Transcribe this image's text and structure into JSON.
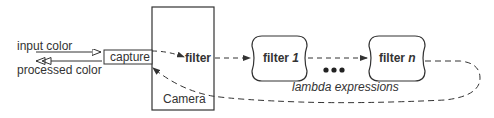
{
  "diagram": {
    "left_labels": {
      "input": "input color",
      "output": "processed color"
    },
    "capture_label": "capture",
    "camera_label": "Camera",
    "filter_label": "filter",
    "filters": [
      {
        "prefix": "filter ",
        "suffix": "1"
      },
      {
        "prefix": "filter ",
        "suffix": "n"
      }
    ],
    "ellipsis": "●●●",
    "caption": "lambda expressions",
    "colors": {
      "stroke": "#333333",
      "text": "#333333",
      "background": "#ffffff"
    }
  }
}
